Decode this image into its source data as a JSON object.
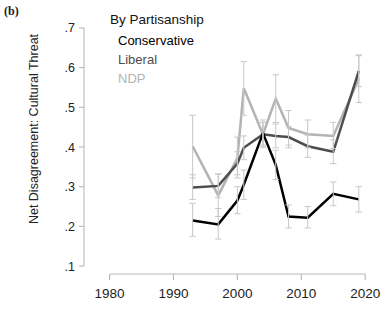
{
  "panel": {
    "label": "(b)"
  },
  "axes": {
    "ylabel": "Net Disagreement: Cultural Threat",
    "xlabel": "",
    "yticks": [
      ".1",
      ".2",
      ".3",
      ".4",
      ".5",
      ".6",
      ".7"
    ],
    "xticks": [
      "1980",
      "1990",
      "2000",
      "2010",
      "2020"
    ]
  },
  "legend": {
    "title": "By Partisanship",
    "entries": [
      {
        "label": "Conservative",
        "color": "#000000"
      },
      {
        "label": "Liberal",
        "color": "#4d4d4d"
      },
      {
        "label": "NDP",
        "color": "#b3b3b3"
      }
    ]
  },
  "chart_data": {
    "type": "line",
    "title": "By Partisanship",
    "xlabel": "",
    "ylabel": "Net Disagreement: Cultural Threat",
    "xlim": [
      1976,
      2022
    ],
    "ylim": [
      0.08,
      0.72
    ],
    "yticks": [
      0.1,
      0.2,
      0.3,
      0.4,
      0.5,
      0.6,
      0.7
    ],
    "xticks": [
      1980,
      1990,
      2000,
      2010,
      2020
    ],
    "grid": false,
    "legend_position": "top-right-inside",
    "error_bars": "95% CI",
    "x": [
      1993,
      1997,
      2000,
      2001,
      2004,
      2006,
      2008,
      2011,
      2015,
      2019
    ],
    "series": [
      {
        "name": "Conservative",
        "color": "#000000",
        "values": [
          0.215,
          0.205,
          0.265,
          0.305,
          0.435,
          0.355,
          0.225,
          0.222,
          0.282,
          0.268
        ],
        "err_low": [
          0.175,
          0.168,
          0.232,
          0.268,
          0.405,
          0.318,
          0.196,
          0.196,
          0.252,
          0.236
        ],
        "err_high": [
          0.258,
          0.245,
          0.3,
          0.342,
          0.462,
          0.392,
          0.254,
          0.25,
          0.312,
          0.3
        ]
      },
      {
        "name": "Liberal",
        "color": "#4d4d4d",
        "values": [
          0.298,
          0.302,
          0.358,
          0.398,
          0.432,
          0.428,
          0.425,
          0.402,
          0.388,
          0.592
        ],
        "err_low": [
          0.268,
          0.272,
          0.33,
          0.368,
          0.402,
          0.398,
          0.398,
          0.374,
          0.358,
          0.552
        ],
        "err_high": [
          0.33,
          0.332,
          0.388,
          0.428,
          0.462,
          0.458,
          0.452,
          0.43,
          0.418,
          0.63
        ]
      },
      {
        "name": "NDP",
        "color": "#b3b3b3",
        "values": [
          0.402,
          0.278,
          0.372,
          0.548,
          0.432,
          0.522,
          0.448,
          0.432,
          0.428,
          0.572
        ],
        "err_low": [
          0.322,
          0.225,
          0.322,
          0.48,
          0.398,
          0.462,
          0.405,
          0.398,
          0.396,
          0.512
        ],
        "err_high": [
          0.48,
          0.332,
          0.425,
          0.615,
          0.468,
          0.582,
          0.492,
          0.468,
          0.462,
          0.632
        ]
      }
    ]
  }
}
